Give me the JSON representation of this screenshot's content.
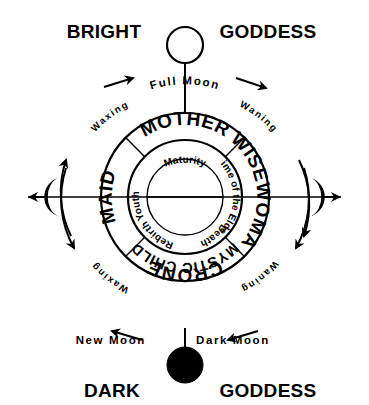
{
  "diagram": {
    "title_top_left": "BRIGHT",
    "title_top_right": "GODDESS",
    "title_bottom_left": "DARK",
    "title_bottom_right": "GODDESS",
    "moon_phases": {
      "full_moon": "Full Moon",
      "new_moon": "New Moon",
      "dark_moon": "Dark Moon"
    },
    "cycle_labels": {
      "waxing_upper": "Waxing",
      "waning_upper": "Waning",
      "waxing_lower": "Waxing",
      "waning_lower": "Waning"
    },
    "archetypes": [
      {
        "name": "MOTHER",
        "position": "top"
      },
      {
        "name": "WISEWOMAN",
        "position": "right"
      },
      {
        "name": "CRONE",
        "position": "bottom-outer"
      },
      {
        "name": "MYSTIC CHILD",
        "position": "bottom-inner"
      },
      {
        "name": "MAID",
        "position": "left"
      }
    ],
    "life_stages": [
      {
        "name": "Maturity",
        "position": "top"
      },
      {
        "name": "Time of the Elder",
        "position": "right"
      },
      {
        "name": "Death",
        "position": "bottom-right"
      },
      {
        "name": "Rebirth",
        "position": "bottom-left"
      },
      {
        "name": "Youth",
        "position": "left"
      }
    ],
    "icons": {
      "top_moon": "full-moon-icon",
      "bottom_moon": "dark-moon-icon",
      "left_moon": "waxing-crescent-icon",
      "right_moon": "waning-crescent-icon"
    },
    "colors": {
      "ink": "#000000",
      "paper": "#ffffff"
    }
  }
}
